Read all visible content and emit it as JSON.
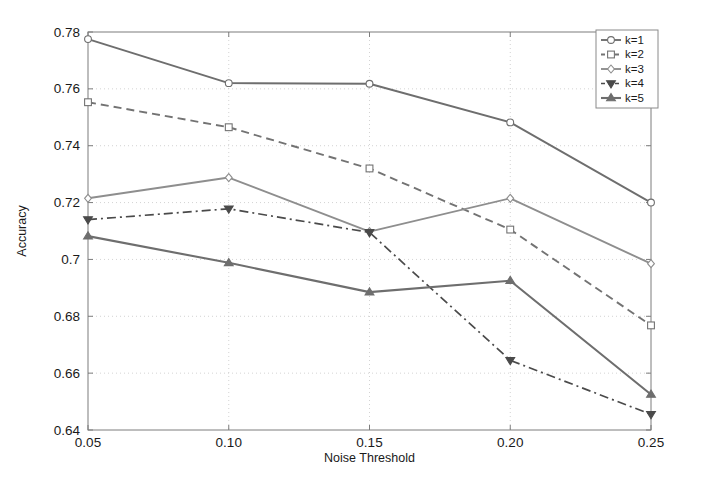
{
  "chart_data": {
    "type": "line",
    "title": "",
    "xlabel": "Noise Threshold",
    "ylabel": "Accuracy",
    "x": [
      0.05,
      0.1,
      0.15,
      0.2,
      0.25
    ],
    "xtick_labels": [
      "0.05",
      "0.10",
      "0.15",
      "0.20",
      "0.25"
    ],
    "ytick_labels": [
      "0.64",
      "0.66",
      "0.68",
      "0.7",
      "0.72",
      "0.74",
      "0.76",
      "0.78"
    ],
    "yticks": [
      0.64,
      0.66,
      0.68,
      0.7,
      0.72,
      0.74,
      0.76,
      0.78
    ],
    "xlim": [
      0.05,
      0.25
    ],
    "ylim": [
      0.64,
      0.78
    ],
    "grid": true,
    "legend_position": "top-right",
    "series": [
      {
        "name": "k=1",
        "values": [
          0.7775,
          0.762,
          0.7618,
          0.7482,
          0.72
        ],
        "color": "#6e6e6e",
        "linestyle": "solid",
        "marker": "circle",
        "width": 1.9
      },
      {
        "name": "k=2",
        "values": [
          0.7553,
          0.7465,
          0.732,
          0.7105,
          0.6768
        ],
        "color": "#737373",
        "linestyle": "dashed",
        "marker": "square",
        "width": 1.9
      },
      {
        "name": "k=3",
        "values": [
          0.7215,
          0.7288,
          0.7098,
          0.7215,
          0.6985
        ],
        "color": "#8e8e8e",
        "linestyle": "solid",
        "marker": "diamond",
        "width": 1.9
      },
      {
        "name": "k=4",
        "values": [
          0.714,
          0.7178,
          0.7095,
          0.6645,
          0.6455
        ],
        "color": "#4a4a4a",
        "linestyle": "dashdot",
        "marker": "triangle-down",
        "width": 1.7
      },
      {
        "name": "k=5",
        "values": [
          0.7082,
          0.6988,
          0.6885,
          0.6925,
          0.6525
        ],
        "color": "#6e6e6e",
        "linestyle": "solid",
        "marker": "triangle-up",
        "width": 2.1
      }
    ]
  },
  "plot_geometry": {
    "left": 88,
    "right": 651,
    "top": 32,
    "bottom": 430
  },
  "legend": {
    "x": 596,
    "y": 30,
    "width": 62,
    "height": 78,
    "row_height": 14.5
  }
}
